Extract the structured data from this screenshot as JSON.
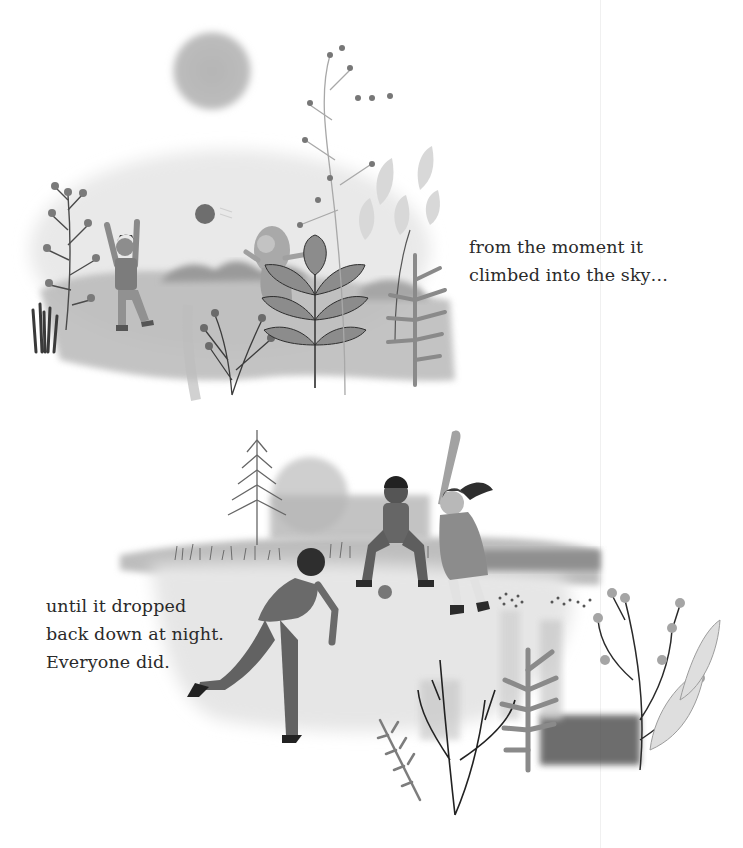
{
  "page": {
    "type": "picture-book-spread",
    "background": "#ffffff",
    "ink_color": "#2a2a2a"
  },
  "top_scene": {
    "description": "Two children playing catch with a ball in a hazy meadow under a big sun, framed by plants",
    "elements": [
      "sun",
      "ball",
      "child-throwing",
      "child-with-long-hair",
      "hills",
      "branchy-plant",
      "grass-tufts",
      "leafy-fern",
      "wildflowers"
    ],
    "caption": {
      "lines": [
        "from the moment it",
        "climbed into the sky…"
      ]
    }
  },
  "bottom_scene": {
    "description": "Kids playing baseball in a field; a batter with ponytail, a crouching catcher, and a child pitching in the foreground",
    "elements": [
      "pine-tree",
      "faded-sun",
      "batter-with-bat",
      "catcher",
      "pitcher",
      "ball",
      "tall-grass",
      "foreground-plants"
    ],
    "caption": {
      "lines": [
        "until it dropped",
        "back down at night.",
        "Everyone did."
      ]
    }
  }
}
